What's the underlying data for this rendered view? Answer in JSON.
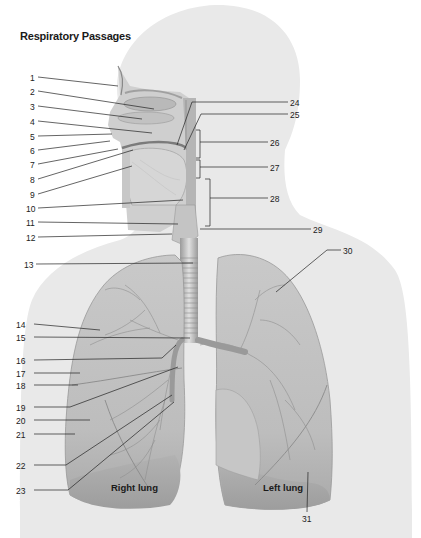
{
  "title": "Respiratory Passages",
  "lung_labels": {
    "right": "Right lung",
    "left": "Left lung"
  },
  "callouts": [
    {
      "n": "1",
      "x": 30,
      "y": 73
    },
    {
      "n": "2",
      "x": 30,
      "y": 87
    },
    {
      "n": "3",
      "x": 30,
      "y": 102
    },
    {
      "n": "4",
      "x": 30,
      "y": 117
    },
    {
      "n": "5",
      "x": 30,
      "y": 132
    },
    {
      "n": "6",
      "x": 30,
      "y": 146
    },
    {
      "n": "7",
      "x": 30,
      "y": 160
    },
    {
      "n": "8",
      "x": 30,
      "y": 175
    },
    {
      "n": "9",
      "x": 30,
      "y": 190
    },
    {
      "n": "10",
      "x": 26,
      "y": 204
    },
    {
      "n": "11",
      "x": 26,
      "y": 218
    },
    {
      "n": "12",
      "x": 26,
      "y": 233
    },
    {
      "n": "13",
      "x": 24,
      "y": 260
    },
    {
      "n": "14",
      "x": 16,
      "y": 320
    },
    {
      "n": "15",
      "x": 16,
      "y": 333
    },
    {
      "n": "16",
      "x": 16,
      "y": 356
    },
    {
      "n": "17",
      "x": 16,
      "y": 369
    },
    {
      "n": "18",
      "x": 16,
      "y": 381
    },
    {
      "n": "19",
      "x": 16,
      "y": 403
    },
    {
      "n": "20",
      "x": 16,
      "y": 416
    },
    {
      "n": "21",
      "x": 16,
      "y": 430
    },
    {
      "n": "22",
      "x": 16,
      "y": 461
    },
    {
      "n": "23",
      "x": 16,
      "y": 486
    },
    {
      "n": "24",
      "x": 290,
      "y": 98
    },
    {
      "n": "25",
      "x": 290,
      "y": 110
    },
    {
      "n": "26",
      "x": 270,
      "y": 138
    },
    {
      "n": "27",
      "x": 270,
      "y": 163
    },
    {
      "n": "28",
      "x": 270,
      "y": 194
    },
    {
      "n": "29",
      "x": 313,
      "y": 225
    },
    {
      "n": "30",
      "x": 343,
      "y": 246
    },
    {
      "n": "31",
      "x": 302,
      "y": 514
    }
  ]
}
